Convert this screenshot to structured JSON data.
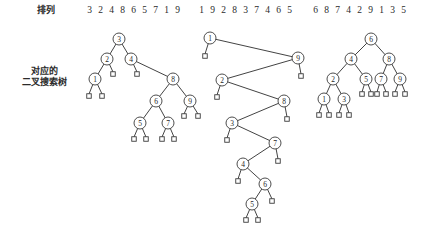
{
  "labels": {
    "permutation": "排列",
    "bst_line1": "对应的",
    "bst_line2": "二叉搜索树"
  },
  "colors": {
    "background": "#ffffff",
    "stroke": "#3a3a3a",
    "edge": "#2e2e2e",
    "text": "#1f1f1f"
  },
  "sequences": [
    {
      "id": "seq-0",
      "digits": [
        "3",
        "2",
        "4",
        "8",
        "6",
        "5",
        "7",
        "1",
        "9"
      ]
    },
    {
      "id": "seq-1",
      "digits": [
        "1",
        "9",
        "2",
        "8",
        "3",
        "7",
        "4",
        "6",
        "5"
      ]
    },
    {
      "id": "seq-2",
      "digits": [
        "6",
        "8",
        "7",
        "4",
        "2",
        "9",
        "1",
        "3",
        "5"
      ]
    }
  ],
  "chart_data": {
    "type": "diagram",
    "node_radius": 6,
    "leaf_size": 4.5,
    "trees": [
      {
        "name": "tree-1",
        "sequence": [
          "3",
          "2",
          "4",
          "8",
          "6",
          "5",
          "7",
          "1",
          "9"
        ],
        "nodes": [
          {
            "label": "3",
            "x": 119,
            "y": 39
          },
          {
            "label": "2",
            "x": 107,
            "y": 59
          },
          {
            "label": "4",
            "x": 131,
            "y": 59
          },
          {
            "label": "1",
            "x": 95,
            "y": 79
          },
          {
            "label": "8",
            "x": 173,
            "y": 79
          },
          {
            "label": "6",
            "x": 156,
            "y": 101
          },
          {
            "label": "9",
            "x": 190,
            "y": 101
          },
          {
            "label": "5",
            "x": 140,
            "y": 123
          },
          {
            "label": "7",
            "x": 168,
            "y": 123
          }
        ],
        "edges": [
          [
            119,
            39,
            107,
            59
          ],
          [
            119,
            39,
            131,
            59
          ],
          [
            107,
            59,
            95,
            79
          ],
          [
            107,
            59,
            113,
            72
          ],
          [
            131,
            59,
            137,
            72
          ],
          [
            131,
            59,
            173,
            79
          ],
          [
            173,
            79,
            156,
            101
          ],
          [
            173,
            79,
            190,
            101
          ],
          [
            156,
            101,
            140,
            123
          ],
          [
            156,
            101,
            168,
            123
          ],
          [
            190,
            101,
            184,
            114
          ],
          [
            190,
            101,
            198,
            114
          ],
          [
            95,
            79,
            89,
            94
          ],
          [
            95,
            79,
            102,
            94
          ],
          [
            140,
            123,
            134,
            137
          ],
          [
            140,
            123,
            146,
            137
          ],
          [
            168,
            123,
            162,
            137
          ],
          [
            168,
            123,
            174,
            137
          ]
        ],
        "leaves": [
          {
            "x": 113,
            "y": 74
          },
          {
            "x": 137,
            "y": 74
          },
          {
            "x": 89,
            "y": 96
          },
          {
            "x": 102,
            "y": 96
          },
          {
            "x": 184,
            "y": 116
          },
          {
            "x": 198,
            "y": 116
          },
          {
            "x": 134,
            "y": 139
          },
          {
            "x": 146,
            "y": 139
          },
          {
            "x": 162,
            "y": 139
          },
          {
            "x": 174,
            "y": 139
          }
        ]
      },
      {
        "name": "tree-2",
        "sequence": [
          "1",
          "9",
          "2",
          "8",
          "3",
          "7",
          "4",
          "6",
          "5"
        ],
        "nodes": [
          {
            "label": "1",
            "x": 210,
            "y": 38
          },
          {
            "label": "9",
            "x": 298,
            "y": 58
          },
          {
            "label": "2",
            "x": 222,
            "y": 80
          },
          {
            "label": "8",
            "x": 284,
            "y": 101
          },
          {
            "label": "3",
            "x": 232,
            "y": 123
          },
          {
            "label": "7",
            "x": 275,
            "y": 143
          },
          {
            "label": "4",
            "x": 243,
            "y": 164
          },
          {
            "label": "6",
            "x": 265,
            "y": 184
          },
          {
            "label": "5",
            "x": 252,
            "y": 204
          }
        ],
        "edges": [
          [
            210,
            38,
            298,
            58
          ],
          [
            210,
            38,
            205,
            54
          ],
          [
            298,
            58,
            222,
            80
          ],
          [
            298,
            58,
            301,
            74
          ],
          [
            222,
            80,
            284,
            101
          ],
          [
            222,
            80,
            217,
            95
          ],
          [
            284,
            101,
            232,
            123
          ],
          [
            284,
            101,
            287,
            117
          ],
          [
            232,
            123,
            275,
            143
          ],
          [
            232,
            123,
            227,
            138
          ],
          [
            275,
            143,
            243,
            164
          ],
          [
            275,
            143,
            278,
            159
          ],
          [
            243,
            164,
            265,
            184
          ],
          [
            243,
            164,
            238,
            179
          ],
          [
            265,
            184,
            252,
            204
          ],
          [
            265,
            184,
            272,
            199
          ],
          [
            252,
            204,
            246,
            218
          ],
          [
            252,
            204,
            258,
            218
          ]
        ],
        "leaves": [
          {
            "x": 205,
            "y": 56
          },
          {
            "x": 301,
            "y": 76
          },
          {
            "x": 217,
            "y": 97
          },
          {
            "x": 287,
            "y": 119
          },
          {
            "x": 227,
            "y": 140
          },
          {
            "x": 278,
            "y": 161
          },
          {
            "x": 238,
            "y": 181
          },
          {
            "x": 272,
            "y": 201
          },
          {
            "x": 246,
            "y": 220
          },
          {
            "x": 258,
            "y": 220
          }
        ]
      },
      {
        "name": "tree-3",
        "sequence": [
          "6",
          "8",
          "7",
          "4",
          "2",
          "9",
          "1",
          "3",
          "5"
        ],
        "nodes": [
          {
            "label": "6",
            "x": 371,
            "y": 39
          },
          {
            "label": "4",
            "x": 351,
            "y": 59
          },
          {
            "label": "8",
            "x": 389,
            "y": 59
          },
          {
            "label": "2",
            "x": 333,
            "y": 79
          },
          {
            "label": "5",
            "x": 366,
            "y": 79
          },
          {
            "label": "7",
            "x": 381,
            "y": 79
          },
          {
            "label": "9",
            "x": 400,
            "y": 79
          },
          {
            "label": "1",
            "x": 324,
            "y": 99
          },
          {
            "label": "3",
            "x": 344,
            "y": 99
          }
        ],
        "edges": [
          [
            371,
            39,
            351,
            59
          ],
          [
            371,
            39,
            389,
            59
          ],
          [
            351,
            59,
            333,
            79
          ],
          [
            351,
            59,
            366,
            79
          ],
          [
            389,
            59,
            381,
            79
          ],
          [
            389,
            59,
            400,
            79
          ],
          [
            333,
            79,
            324,
            99
          ],
          [
            333,
            79,
            344,
            99
          ],
          [
            366,
            79,
            362,
            92
          ],
          [
            366,
            79,
            371,
            92
          ],
          [
            381,
            79,
            377,
            92
          ],
          [
            381,
            79,
            386,
            92
          ],
          [
            400,
            79,
            395,
            92
          ],
          [
            400,
            79,
            405,
            92
          ],
          [
            324,
            99,
            319,
            113
          ],
          [
            324,
            99,
            329,
            113
          ],
          [
            344,
            99,
            339,
            113
          ],
          [
            344,
            99,
            349,
            113
          ]
        ],
        "leaves": [
          {
            "x": 362,
            "y": 94
          },
          {
            "x": 371,
            "y": 94
          },
          {
            "x": 377,
            "y": 94
          },
          {
            "x": 386,
            "y": 94
          },
          {
            "x": 395,
            "y": 94
          },
          {
            "x": 405,
            "y": 94
          },
          {
            "x": 319,
            "y": 115
          },
          {
            "x": 329,
            "y": 115
          },
          {
            "x": 339,
            "y": 115
          },
          {
            "x": 349,
            "y": 115
          }
        ]
      }
    ]
  }
}
